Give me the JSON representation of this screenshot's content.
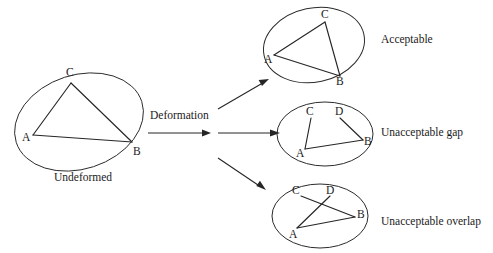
{
  "figure": {
    "background_color": "#ffffff",
    "stroke_color": "#2b2b2b"
  },
  "source": {
    "label": "Undeformed",
    "shape": "ellipse",
    "vertices": [
      {
        "id": "A",
        "label": "A"
      },
      {
        "id": "B",
        "label": "B"
      },
      {
        "id": "C",
        "label": "C"
      }
    ],
    "edges": [
      "A-B",
      "A-C",
      "C-B"
    ]
  },
  "transform": {
    "label": "Deformation",
    "arrow": "right-arrow"
  },
  "results": [
    {
      "id": "acceptable",
      "label": "Acceptable",
      "shape": "ellipse",
      "vertices": [
        {
          "id": "A",
          "label": "A"
        },
        {
          "id": "B",
          "label": "B"
        },
        {
          "id": "C",
          "label": "C"
        }
      ],
      "edges": [
        "A-B",
        "A-C",
        "C-B"
      ],
      "condition": "closed triangle, no gap or overlap"
    },
    {
      "id": "unacceptable-gap",
      "label": "Unacceptable gap",
      "shape": "ellipse",
      "vertices": [
        {
          "id": "A",
          "label": "A"
        },
        {
          "id": "B",
          "label": "B"
        },
        {
          "id": "C",
          "label": "C"
        },
        {
          "id": "D",
          "label": "D"
        }
      ],
      "edges": [
        "A-B",
        "A-C",
        "D-B"
      ],
      "condition": "gap between C and D"
    },
    {
      "id": "unacceptable-overlap",
      "label": "Unacceptable overlap",
      "shape": "ellipse",
      "vertices": [
        {
          "id": "A",
          "label": "A"
        },
        {
          "id": "B",
          "label": "B"
        },
        {
          "id": "C",
          "label": "C"
        },
        {
          "id": "D",
          "label": "D"
        }
      ],
      "edges": [
        "A-B",
        "A-D",
        "C-B"
      ],
      "condition": "segments A-D and C-B cross, producing overlap"
    }
  ],
  "arrows": [
    {
      "id": "to-acceptable",
      "from": "deformation-fan",
      "to": "acceptable"
    },
    {
      "id": "to-gap",
      "from": "deformation-fan",
      "to": "unacceptable-gap"
    },
    {
      "id": "to-overlap",
      "from": "deformation-fan",
      "to": "unacceptable-overlap"
    }
  ]
}
